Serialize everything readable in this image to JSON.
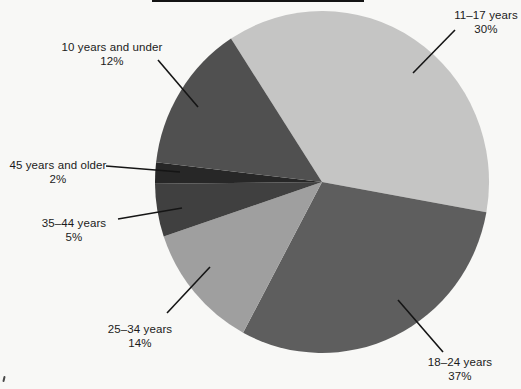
{
  "figure": {
    "background_color": "#f8f8f6",
    "text_color": "#1b1b1b",
    "leader_line_color": "#151515"
  },
  "chart_data": {
    "type": "pie",
    "title": "",
    "legend": "none",
    "labeling": "external callout labels with leader lines",
    "slices": [
      {
        "label": "11–17 years",
        "value_pct": 30,
        "color": "#c5c5c4"
      },
      {
        "label": "18–24 years",
        "value_pct": 37,
        "color": "#5e5e5e"
      },
      {
        "label": "25–34 years",
        "value_pct": 14,
        "color": "#9f9f9f"
      },
      {
        "label": "35–44 years",
        "value_pct": 5,
        "color": "#404040"
      },
      {
        "label": "45 years and older",
        "value_pct": 2,
        "color": "#272727"
      },
      {
        "label": "10 years and under",
        "value_pct": 12,
        "color": "#505050"
      }
    ],
    "render_hints": {
      "cx": 322,
      "cy": 182,
      "rx": 167,
      "ry": 171,
      "start_bearing_deg": 327,
      "direction": "clockwise",
      "drawn_pct": [
        37,
        30,
        12,
        5,
        2,
        14
      ]
    }
  },
  "callouts": [
    {
      "slice": 0,
      "x": 486,
      "y": 8,
      "leader": [
        455,
        30,
        413,
        73
      ]
    },
    {
      "slice": 1,
      "x": 460,
      "y": 355,
      "leader": [
        443,
        352,
        398,
        300
      ]
    },
    {
      "slice": 2,
      "x": 140,
      "y": 322,
      "leader": [
        167,
        313,
        210,
        267
      ]
    },
    {
      "slice": 3,
      "x": 74,
      "y": 216,
      "leader": [
        118,
        219,
        182,
        208
      ]
    },
    {
      "slice": 4,
      "x": 58,
      "y": 158,
      "leader": [
        106,
        166,
        180,
        172
      ]
    },
    {
      "slice": 5,
      "x": 112,
      "y": 40,
      "leader": [
        158,
        60,
        198,
        107
      ]
    }
  ],
  "artifacts": {
    "top_scan_line": {
      "x": 152,
      "width": 212
    },
    "corner_mark": {
      "x": 3,
      "y": 376
    }
  }
}
